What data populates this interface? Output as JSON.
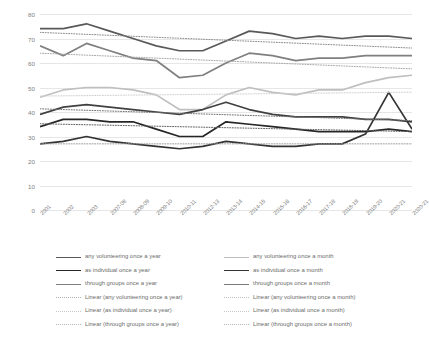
{
  "chart_data": {
    "type": "line",
    "title": "",
    "xlabel": "",
    "ylabel": "",
    "ylim": [
      0,
      80
    ],
    "ytick_step": 10,
    "yticks": [
      "0",
      "10",
      "20",
      "30",
      "40",
      "50",
      "60",
      "70",
      "80"
    ],
    "grid": true,
    "legend_position": "bottom",
    "categories": [
      "2001",
      "2002",
      "2003",
      "2007-08",
      "2008-09",
      "2009-10",
      "2010-11",
      "2012-13",
      "2013-14",
      "2014-15",
      "2015-16",
      "2016-17",
      "2017-18",
      "2018-19",
      "2019-20",
      "2020-21",
      "2020-21"
    ],
    "series": [
      {
        "name": "any volunteering once a year",
        "style": "solid",
        "color": "#595959",
        "values": [
          74,
          74,
          76,
          73,
          70,
          67,
          65,
          65,
          69,
          73,
          72,
          70,
          71,
          70,
          71,
          71,
          70
        ]
      },
      {
        "name": "through groups once a year",
        "style": "solid",
        "color": "#7f7f7f",
        "values": [
          67,
          63,
          68,
          65,
          62,
          61,
          54,
          55,
          60,
          64,
          63,
          61,
          62,
          62,
          63,
          63,
          63
        ]
      },
      {
        "name": "as individual once a year",
        "style": "solid",
        "color": "#bfbfbf",
        "values": [
          46,
          49,
          50,
          50,
          49,
          47,
          41,
          41,
          47,
          50,
          48,
          47,
          49,
          49,
          52,
          54,
          55
        ]
      },
      {
        "name": "any volunteering once a month",
        "style": "solid",
        "color": "#404040",
        "values": [
          39,
          42,
          43,
          42,
          41,
          40,
          39,
          41,
          44,
          41,
          39,
          38,
          38,
          38,
          37,
          37,
          36
        ]
      },
      {
        "name": "through groups once a month",
        "style": "solid",
        "color": "#262626",
        "values": [
          34,
          37,
          37,
          36,
          36,
          33,
          30,
          30,
          36,
          35,
          34,
          33,
          32,
          32,
          32,
          33,
          32
        ]
      },
      {
        "name": "as individual once a month",
        "style": "solid",
        "color": "#333333",
        "values": [
          27,
          28,
          30,
          28,
          27,
          26,
          25,
          26,
          28,
          27,
          26,
          26,
          27,
          27,
          31,
          48,
          33
        ]
      },
      {
        "name": "Linear (any volunteering once a year)",
        "style": "dotted",
        "color": "#8c8c8c",
        "values": [
          72.5,
          72.1,
          71.7,
          71.3,
          70.9,
          70.5,
          70.1,
          69.7,
          69.3,
          68.9,
          68.5,
          68.1,
          67.7,
          67.3,
          66.9,
          66.5,
          66.1
        ]
      },
      {
        "name": "Linear (through groups once a year)",
        "style": "dotted",
        "color": "#a6a6a6",
        "values": [
          64.0,
          63.6,
          63.2,
          62.8,
          62.4,
          62.0,
          61.6,
          61.2,
          60.8,
          60.4,
          60.0,
          59.6,
          59.2,
          58.8,
          58.4,
          58.0,
          57.6
        ]
      },
      {
        "name": "Linear (as individual once a year)",
        "style": "dotted",
        "color": "#d0d0d0",
        "values": [
          46.5,
          46.6,
          46.7,
          46.8,
          46.9,
          47.0,
          47.1,
          47.2,
          47.3,
          47.4,
          47.5,
          47.6,
          47.7,
          47.8,
          47.9,
          48.0,
          48.1
        ]
      },
      {
        "name": "Linear (any volunteering once a month)",
        "style": "dotted",
        "color": "#737373",
        "values": [
          41.3,
          41.0,
          40.7,
          40.4,
          40.1,
          39.8,
          39.5,
          39.2,
          38.9,
          38.6,
          38.3,
          38.0,
          37.7,
          37.4,
          37.1,
          36.8,
          36.5
        ]
      },
      {
        "name": "Linear (through groups once a month)",
        "style": "dotted",
        "color": "#5e5e5e",
        "values": [
          35.2,
          35.0,
          34.8,
          34.6,
          34.4,
          34.2,
          34.0,
          33.8,
          33.6,
          33.4,
          33.2,
          33.0,
          32.8,
          32.6,
          32.4,
          32.2,
          32.0
        ]
      },
      {
        "name": "Linear (through groups once a month)",
        "style": "dotted",
        "color": "#9a9a9a",
        "values": [
          27.0,
          27.0,
          27.0,
          27.0,
          27.0,
          27.0,
          27.0,
          27.0,
          27.0,
          27.0,
          27.0,
          27.0,
          27.0,
          27.0,
          27.0,
          27.0,
          27.0
        ]
      }
    ]
  },
  "legend": {
    "column_a": [
      "any volunteering once a year",
      "as individual once a year",
      "through groups once a year",
      "Linear (any volunteering once a year)",
      "Linear (as individual once a year)",
      "Linear (through groups once a year)"
    ],
    "column_b": [
      "any volunteering once a month",
      "as individual once a month",
      "through groups once a month",
      "Linear (any volunteering once a month)",
      "Linear (as individual once a month)",
      "Linear (through groups once a month)"
    ],
    "swatch_colors_a": [
      "#595959",
      "#262626",
      "#7f7f7f",
      "#b0b0b0",
      "#c8c8c8",
      "#b8b8b8"
    ],
    "swatch_colors_b": [
      "#bfbfbf",
      "#333333",
      "#7a7a7a",
      "#c0c0c0",
      "#c8c8c8",
      "#b8b8b8"
    ],
    "swatch_styles_a": [
      "solid",
      "solid",
      "solid",
      "dotted",
      "dotted",
      "dotted"
    ],
    "swatch_styles_b": [
      "solid",
      "solid",
      "solid",
      "dotted",
      "dotted",
      "dotted"
    ]
  }
}
